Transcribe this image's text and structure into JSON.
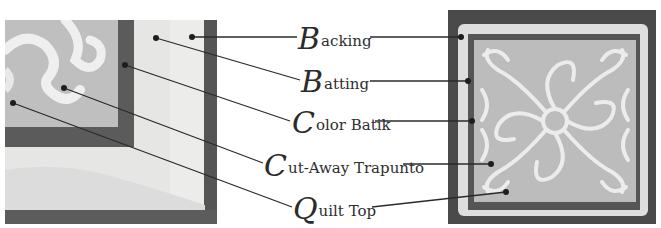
{
  "diagram": {
    "type": "labeled quilt layers",
    "labels": [
      {
        "id": "backing",
        "initial": "B",
        "rest": "acking",
        "text": "Backing"
      },
      {
        "id": "batting",
        "initial": "B",
        "rest": "atting",
        "text": "Batting"
      },
      {
        "id": "color-batik",
        "initial": "C",
        "rest": "olor Batik",
        "text": "Color Batik"
      },
      {
        "id": "cut-away-trapunto",
        "initial": "C",
        "rest": "ut-Away Trapunto",
        "text": "Cut-Away Trapunto"
      },
      {
        "id": "quilt-top",
        "initial": "Q",
        "rest": "uilt Top",
        "text": "Quilt Top"
      }
    ],
    "photos": {
      "left": "close-up corner of quilt layers",
      "right": "full trapunto quilt square"
    }
  },
  "colors": {
    "background": "#ffffff",
    "text": "#2e2e2e",
    "leader_line": "#2a2a2a",
    "dark_border": "#4a4a4a",
    "batik_band": "#5a5a5a",
    "fabric_light": "#e4e4e2",
    "quilt_top": "#bdbdbd",
    "trapunto": "#ececec"
  }
}
